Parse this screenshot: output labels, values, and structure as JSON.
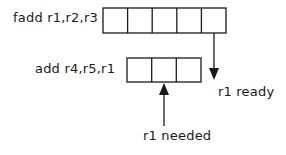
{
  "diagram": {
    "instructions": [
      {
        "text": "fadd r1,r2,r3",
        "stages": 5
      },
      {
        "text": "add r4,r5,r1",
        "stages": 3
      }
    ],
    "annotations": {
      "ready": "r1 ready",
      "needed": "r1 needed"
    },
    "colors": {
      "stroke": "#1a1a1a",
      "background": "#ffffff"
    }
  }
}
